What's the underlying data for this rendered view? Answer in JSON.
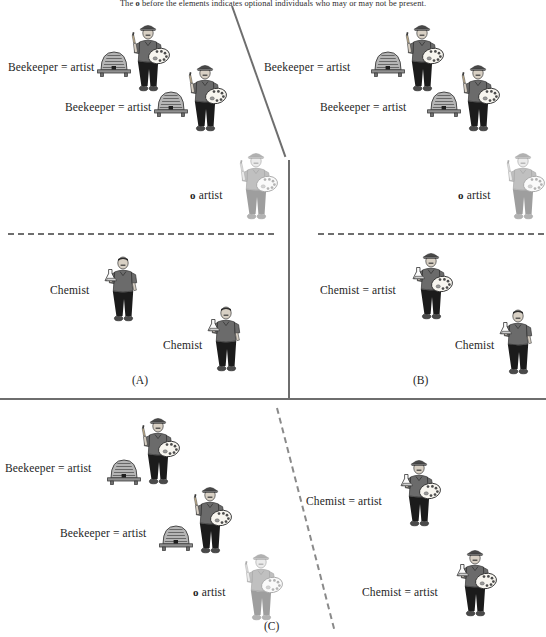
{
  "caption": {
    "prefix": "The ",
    "symbol": "o",
    "suffix": " before the elements indicates optional individuals who may or may not be present."
  },
  "colors": {
    "divider": "#6e6e6e",
    "text": "#1e1e1e",
    "shirt": "#6b6b6b",
    "pants": "#1b1b1b",
    "skin": "#d8d0c4",
    "hive": "#b5b5b5",
    "faded": "#b9b9b9"
  },
  "panels": [
    {
      "id": "A",
      "label": "(A)",
      "top_items": [
        {
          "label": "Beekeeper = artist",
          "figure": "artist",
          "hive": true,
          "optional": false
        },
        {
          "label": "Beekeeper = artist",
          "figure": "artist",
          "hive": true,
          "optional": false
        },
        {
          "label": "o artist",
          "figure": "artist",
          "hive": false,
          "optional": true
        }
      ],
      "bottom_items": [
        {
          "label": "Chemist",
          "figure": "chemist",
          "optional": false
        },
        {
          "label": "Chemist",
          "figure": "chemist",
          "optional": false
        }
      ]
    },
    {
      "id": "B",
      "label": "(B)",
      "top_items": [
        {
          "label": "Beekeeper = artist",
          "figure": "artist",
          "hive": true,
          "optional": false
        },
        {
          "label": "Beekeeper = artist",
          "figure": "artist",
          "hive": true,
          "optional": false
        },
        {
          "label": "o artist",
          "figure": "artist",
          "hive": false,
          "optional": true
        }
      ],
      "bottom_items": [
        {
          "label": "Chemist = artist",
          "figure": "chemist-artist",
          "optional": false
        },
        {
          "label": "Chemist",
          "figure": "chemist",
          "optional": false
        }
      ]
    },
    {
      "id": "C",
      "label": "(C)",
      "top_items": [
        {
          "label": "Beekeeper = artist",
          "figure": "artist",
          "hive": true,
          "optional": false
        },
        {
          "label": "Beekeeper = artist",
          "figure": "artist",
          "hive": true,
          "optional": false
        },
        {
          "label": "o artist",
          "figure": "artist",
          "hive": false,
          "optional": true
        }
      ],
      "bottom_items": [
        {
          "label": "Chemist = artist",
          "figure": "chemist-artist",
          "optional": false
        },
        {
          "label": "Chemist = artist",
          "figure": "chemist-artist",
          "optional": false
        }
      ]
    }
  ]
}
